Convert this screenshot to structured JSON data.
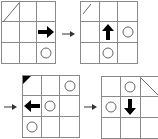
{
  "diagram": {
    "type": "grid-state-sequence",
    "grid_size": 3,
    "panels": [
      {
        "id": 1,
        "corner_marker": "diagonal-line-top-left",
        "agent": {
          "row": 1,
          "col": 2,
          "direction": "right"
        },
        "circles": [
          {
            "row": 2,
            "col": 2
          }
        ]
      },
      {
        "id": 2,
        "corner_marker": "short-diagonal-top-left",
        "agent": {
          "row": 1,
          "col": 1,
          "direction": "up"
        },
        "circles": [
          {
            "row": 1,
            "col": 2
          },
          {
            "row": 2,
            "col": 1
          }
        ]
      },
      {
        "id": 3,
        "corner_marker": "filled-triangle-top-left",
        "agent": {
          "row": 1,
          "col": 0,
          "direction": "left"
        },
        "circles": [
          {
            "row": 0,
            "col": 2
          },
          {
            "row": 1,
            "col": 1
          },
          {
            "row": 2,
            "col": 0
          }
        ]
      },
      {
        "id": 4,
        "corner_marker": "diagonal-line-top-right",
        "agent": {
          "row": 1,
          "col": 1,
          "direction": "down"
        },
        "circles": [
          {
            "row": 0,
            "col": 1
          },
          {
            "row": 1,
            "col": 0
          }
        ]
      }
    ],
    "transitions": [
      "panel1-to-panel2",
      "panel2-to-panel3",
      "panel3-to-panel4"
    ],
    "colors": {
      "grid_line": "#8a8a8a",
      "arrow": "#000000",
      "circle": "#666666"
    }
  }
}
